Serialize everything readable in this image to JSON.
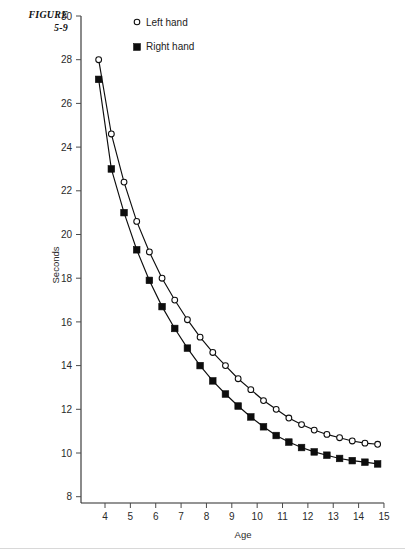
{
  "figure": {
    "label_line1": "FIGURE",
    "label_line2": "5-9"
  },
  "legend": {
    "position": "top-right-inside",
    "entries": [
      {
        "marker": "open-circle-marker",
        "label": "Left hand"
      },
      {
        "marker": "filled-square-marker",
        "label": "Right hand"
      }
    ]
  },
  "chart_data": {
    "type": "line",
    "title": "",
    "subtitle": "",
    "xlabel": "Age",
    "ylabel": "Seconds",
    "xlim": [
      3.55,
      15.4
    ],
    "ylim": [
      7.3,
      30
    ],
    "grid": false,
    "legend_position": "top-right",
    "xticks": [
      4,
      5,
      6,
      7,
      8,
      9,
      10,
      11,
      12,
      13,
      14,
      15
    ],
    "xtick_labels": [
      "4",
      "5",
      "6",
      "7",
      "8",
      "9",
      "10",
      "11",
      "12",
      "13",
      "14",
      "15"
    ],
    "yticks": [
      8,
      10,
      12,
      14,
      16,
      18,
      20,
      22,
      24,
      26,
      28,
      30
    ],
    "ytick_labels": [
      "8",
      "10",
      "12",
      "14",
      "16",
      "18",
      "20",
      "22",
      "24",
      "26",
      "28",
      "30"
    ],
    "x": [
      3.75,
      4.25,
      4.75,
      5.25,
      5.75,
      6.25,
      6.75,
      7.25,
      7.75,
      8.25,
      8.75,
      9.25,
      9.75,
      10.25,
      10.75,
      11.25,
      11.75,
      12.25,
      12.75,
      13.25,
      13.75,
      14.25,
      14.75
    ],
    "series": [
      {
        "name": "Left hand",
        "marker": "open-circle",
        "values": [
          28.0,
          24.6,
          22.4,
          20.6,
          19.2,
          18.0,
          17.0,
          16.1,
          15.3,
          14.6,
          14.0,
          13.4,
          12.9,
          12.4,
          12.0,
          11.6,
          11.3,
          11.05,
          10.85,
          10.7,
          10.55,
          10.45,
          10.4
        ]
      },
      {
        "name": "Right hand",
        "marker": "filled-square",
        "values": [
          27.1,
          23.0,
          21.0,
          19.3,
          17.9,
          16.7,
          15.7,
          14.8,
          14.0,
          13.3,
          12.7,
          12.15,
          11.65,
          11.2,
          10.8,
          10.5,
          10.25,
          10.05,
          9.9,
          9.75,
          9.65,
          9.58,
          9.5
        ]
      }
    ]
  }
}
